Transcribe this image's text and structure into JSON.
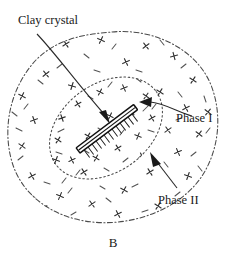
{
  "figure": {
    "caption": "B",
    "width": 239,
    "height": 255,
    "background_color": "#ffffff"
  },
  "labels": {
    "clay_crystal": "Clay crystal",
    "phase_one": "Phase I",
    "phase_two": "Phase II"
  },
  "colors": {
    "ink": "#1a1a1a",
    "boundary": "#4a4a4a",
    "mark": "#333333",
    "dash": "#555555",
    "crystal_outline": "#111111",
    "crystal_fill": "#ffffff"
  },
  "icons": {
    "clay_crystal_leader": "curved-leader-arrow-icon",
    "phase_one_leader": "curved-leader-arrow-icon",
    "phase_two_leader": "straight-leader-arrow-icon",
    "crystal": "clay-crystal-bar-icon",
    "phase_one_boundary": "dotted-ellipse-icon",
    "phase_two_boundary": "dash-dot-blob-icon"
  },
  "diagram_data": {
    "type": "schematic",
    "description": "Schematic of a clay crystal surrounded by two concentric polymer phase regions",
    "crystal": {
      "name": "Clay crystal",
      "start": [
        78,
        151
      ],
      "end": [
        136,
        107
      ],
      "thickness": 5,
      "angle_deg": -37,
      "hatch_count": 14,
      "hatch_side": "lower-right",
      "hatch_length": 9
    },
    "regions": [
      {
        "name": "Phase I",
        "style": "dotted",
        "shape": "ellipse",
        "center": [
          106,
          128
        ],
        "radius_x": 62,
        "radius_y": 44,
        "rotation_deg": -36
      },
      {
        "name": "Phase II",
        "style": "dash-dot",
        "shape": "irregular-blob",
        "center": [
          112,
          124
        ],
        "radius_x": 103,
        "radius_y": 92
      }
    ],
    "annotations": [
      {
        "label": "Clay crystal",
        "text_position": [
          18,
          22
        ],
        "leader": "curve",
        "arrow_target": [
          112,
          122
        ],
        "arrow_direction": "down-right"
      },
      {
        "label": "Phase I",
        "text_position": [
          176,
          120
        ],
        "leader": "curve",
        "arrow_target": [
          141,
          104
        ],
        "arrow_direction": "left"
      },
      {
        "label": "Phase II",
        "text_position": [
          158,
          202
        ],
        "leader": "straight",
        "arrow_target": [
          152,
          157
        ],
        "arrow_direction": "up-left"
      }
    ],
    "filler_marks": {
      "x_glyph_count": 58,
      "dash_count": 72,
      "meaning": "polymer chains and crosslink markers distributed across both phases"
    }
  }
}
